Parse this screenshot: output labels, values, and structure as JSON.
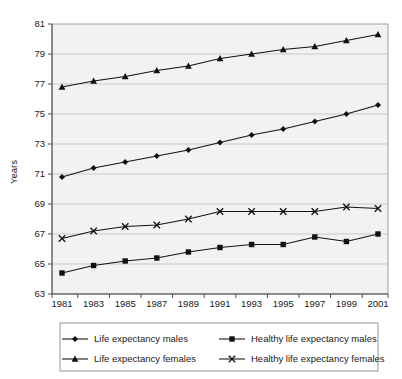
{
  "chart_data": {
    "type": "line",
    "title": "",
    "xlabel": "",
    "ylabel": "Years",
    "x": [
      1981,
      1983,
      1985,
      1987,
      1989,
      1991,
      1993,
      1995,
      1997,
      1999,
      2001
    ],
    "xtick_labels": [
      "1981",
      "1983",
      "1985",
      "1987",
      "1989",
      "1991",
      "1993",
      "1995",
      "1997",
      "1999",
      "2001"
    ],
    "ytick_labels": [
      "81",
      "79",
      "77",
      "75",
      "73",
      "71",
      "69",
      "67",
      "65",
      "63"
    ],
    "ylim": [
      63,
      81
    ],
    "ytick_step": 2,
    "grid": true,
    "legend_position": "bottom",
    "series": [
      {
        "name": "Life expectancy males",
        "marker": "diamond",
        "color": "#111111",
        "values": [
          70.8,
          71.4,
          71.8,
          72.2,
          72.6,
          73.1,
          73.6,
          74.0,
          74.5,
          75.0,
          75.6
        ]
      },
      {
        "name": "Healthy life expectancy males",
        "marker": "square",
        "color": "#111111",
        "values": [
          64.4,
          64.9,
          65.2,
          65.4,
          65.8,
          66.1,
          66.3,
          66.3,
          66.8,
          66.5,
          67.0
        ]
      },
      {
        "name": "Life expectancy females",
        "marker": "triangle",
        "color": "#111111",
        "values": [
          76.8,
          77.2,
          77.5,
          77.9,
          78.2,
          78.7,
          79.0,
          79.3,
          79.5,
          79.9,
          80.3
        ]
      },
      {
        "name": "Healthy life expectancy females",
        "marker": "x",
        "color": "#111111",
        "values": [
          66.7,
          67.2,
          67.5,
          67.6,
          68.0,
          68.5,
          68.5,
          68.5,
          68.5,
          68.8,
          68.7
        ]
      }
    ]
  },
  "axis": {
    "y_title": "Years"
  },
  "legend": {
    "entries": [
      {
        "label": "Life expectancy males",
        "marker": "diamond"
      },
      {
        "label": "Healthy life expectancy males",
        "marker": "square"
      },
      {
        "label": "Life expectancy females",
        "marker": "triangle"
      },
      {
        "label": "Healthy life expectancy females",
        "marker": "x"
      }
    ]
  }
}
